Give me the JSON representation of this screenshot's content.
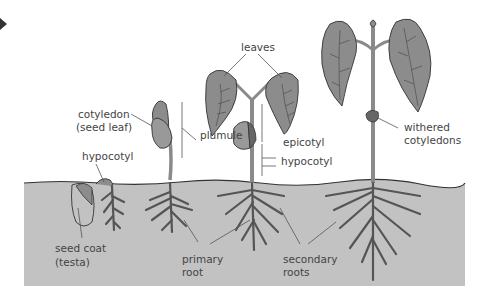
{
  "diagram": {
    "soil_color": "#c2c2c2",
    "leaf_color": "#8c8c8c",
    "stem_color": "#8a8a8a",
    "outline_color": "#333333",
    "labels": {
      "leaves": "leaves",
      "cotyledon_1": "cotyledon",
      "cotyledon_2": "(seed leaf)",
      "plumule": "plumule",
      "epicotyl": "epicotyl",
      "hypocotyl_right": "hypocotyl",
      "hypocotyl_left": "hypocotyl",
      "withered_1": "withered",
      "withered_2": "cotyledons",
      "seed_coat_1": "seed coat",
      "seed_coat_2": "(testa)",
      "primary_1": "primary",
      "primary_2": "root",
      "secondary_1": "secondary",
      "secondary_2": "roots"
    }
  }
}
